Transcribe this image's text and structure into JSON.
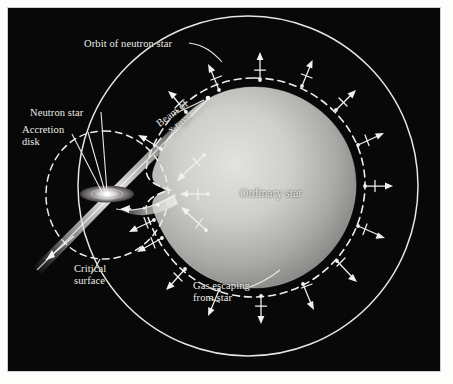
{
  "figure": {
    "kind": "astronomy-diagram",
    "background_color": "#050505",
    "ink_color": "#efeee9",
    "border_color": "#ffffff"
  },
  "labels": {
    "orbit": "Orbit of neutron star",
    "neutron_star": "Neutron star",
    "accretion_disk": "Accretion\ndisk",
    "beam": "Beam of\nx rays",
    "critical_surface": "Critical\nsurface",
    "ordinary_star": "Ordinary star",
    "gas_escaping": "Gas escaping\nfrom star"
  },
  "diagram_data": {
    "type": "diagram",
    "orbit_circle": {
      "cx": 248,
      "cy": 186,
      "r": 178,
      "style": "solid",
      "color": "#e8e7e2"
    },
    "ordinary_star": {
      "cx": 248,
      "cy": 183,
      "rx": 104,
      "ry": 96,
      "fill_center": "#d6d6d2",
      "fill_edge": "#7e7e7c",
      "note": "teardrop distorted toward neutron star"
    },
    "critical_surface_star": {
      "style": "dashed",
      "note": "Roche lobe of ordinary star, just outside the stellar limb"
    },
    "critical_surface_neutron": {
      "cx": 104,
      "cy": 188,
      "r": 58,
      "style": "dashed",
      "note": "Roche lobe of the neutron star"
    },
    "lagrange_point": {
      "x": 170,
      "y": 190
    },
    "neutron_star": {
      "x": 104,
      "y": 188
    },
    "accretion_disk": {
      "cx": 104,
      "cy": 188,
      "rx": 26,
      "ry": 8
    },
    "xray_beam": {
      "angle_deg": -37,
      "upper_tip": {
        "x": 206,
        "y": 100
      },
      "lower_tip": {
        "x": 33,
        "y": 266
      },
      "note": "double-sided cone through the neutron star"
    },
    "gas_stream": {
      "from": {
        "x": 170,
        "y": 192
      },
      "to": {
        "x": 112,
        "y": 196
      },
      "note": "curving stream of gas from L1 into the disk"
    },
    "escaping_arrows": {
      "count": 20,
      "note": "radial arrows crossing the critical surface of the ordinary star"
    }
  }
}
